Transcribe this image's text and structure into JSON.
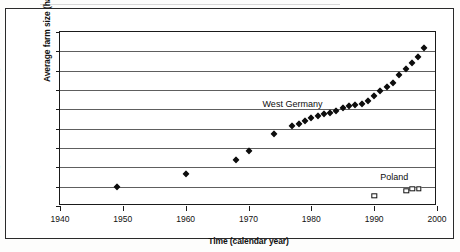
{
  "chart_data": {
    "type": "scatter",
    "title": "",
    "xlabel": "Time (calendar year)",
    "ylabel": "Average farm size (ha)",
    "xlim": [
      1940,
      2000
    ],
    "ylim": [
      6,
      24
    ],
    "xticks": [
      1940,
      1950,
      1960,
      1970,
      1980,
      1990,
      2000
    ],
    "yticks": [
      6,
      8,
      10,
      12,
      14,
      16,
      18,
      20,
      22,
      24
    ],
    "grid": "horizontal",
    "legend": "inline-annotations",
    "annotations": [
      {
        "text": "West Germany",
        "x": 1977.0,
        "y": 16.6
      },
      {
        "text": "Poland",
        "x": 1993.2,
        "y": 8.95
      }
    ],
    "series": [
      {
        "name": "West Germany",
        "marker": "filled-diamond",
        "color": "#0d0d0d",
        "points": [
          {
            "x": 1949,
            "y": 8.0
          },
          {
            "x": 1960,
            "y": 9.35
          },
          {
            "x": 1968,
            "y": 10.8
          },
          {
            "x": 1970,
            "y": 11.7
          },
          {
            "x": 1974,
            "y": 13.5
          },
          {
            "x": 1977,
            "y": 14.3
          },
          {
            "x": 1978,
            "y": 14.5
          },
          {
            "x": 1979,
            "y": 14.8
          },
          {
            "x": 1980,
            "y": 15.1
          },
          {
            "x": 1981,
            "y": 15.3
          },
          {
            "x": 1982,
            "y": 15.5
          },
          {
            "x": 1983,
            "y": 15.6
          },
          {
            "x": 1984,
            "y": 15.8
          },
          {
            "x": 1985,
            "y": 16.1
          },
          {
            "x": 1986,
            "y": 16.3
          },
          {
            "x": 1987,
            "y": 16.4
          },
          {
            "x": 1988,
            "y": 16.6
          },
          {
            "x": 1989,
            "y": 16.9
          },
          {
            "x": 1990,
            "y": 17.4
          },
          {
            "x": 1991,
            "y": 17.9
          },
          {
            "x": 1992,
            "y": 18.3
          },
          {
            "x": 1993,
            "y": 18.7
          },
          {
            "x": 1994,
            "y": 19.6
          },
          {
            "x": 1995,
            "y": 20.2
          },
          {
            "x": 1996,
            "y": 20.8
          },
          {
            "x": 1997,
            "y": 21.4
          },
          {
            "x": 1998,
            "y": 22.3
          }
        ]
      },
      {
        "name": "Poland",
        "marker": "open-square",
        "color": "#111111",
        "points": [
          {
            "x": 1990.0,
            "y": 7.05
          },
          {
            "x": 1995.1,
            "y": 7.6
          },
          {
            "x": 1996.1,
            "y": 7.8
          },
          {
            "x": 1997.1,
            "y": 7.75
          }
        ]
      }
    ]
  }
}
